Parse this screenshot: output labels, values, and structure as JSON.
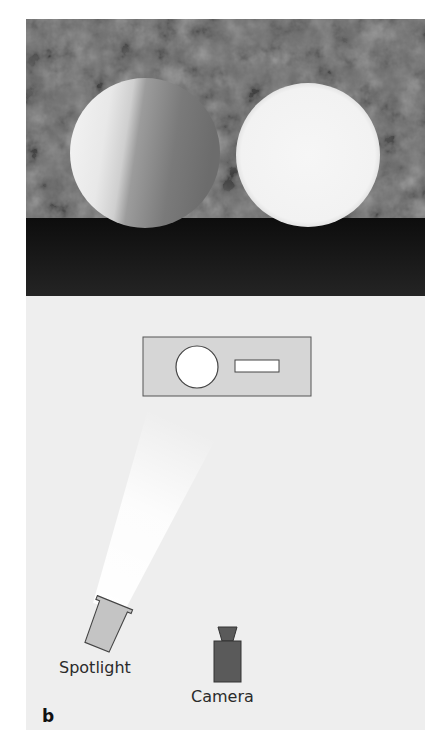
{
  "figure": {
    "panel_label": "b",
    "photo": {
      "description": "Rendered scene: two white spheres on a dark floor in front of a mottled gray backdrop",
      "left_sphere": "shaded sphere (lit from the side)",
      "right_sphere": "uniformly bright sphere"
    },
    "diagram": {
      "labels": {
        "spotlight": "Spotlight",
        "camera": "Camera"
      }
    },
    "colors": {
      "panel_bg": "#eeeeee",
      "backdrop": "#6a6a6a",
      "floor": "#151515",
      "scene_box": "#d6d6d6",
      "spotlight": "#c4c4c4",
      "camera": "#5a5a5a",
      "beam": "#ffffff"
    }
  }
}
